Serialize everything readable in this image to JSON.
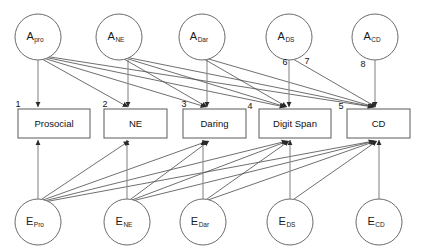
{
  "diagram": {
    "type": "path-diagram",
    "canvas": {
      "width": 430,
      "height": 251,
      "background": "#ffffff"
    },
    "colors": {
      "node_stroke": "#6b6b6b",
      "box_stroke": "#5a5a5a",
      "path_stroke": "#4a4a4a",
      "vertical_path_stroke": "#8a8a8a",
      "text": "#111111",
      "background": "#ffffff"
    },
    "genetic_factors": [
      {
        "id": "a-pro",
        "base": "A",
        "sub": "pro",
        "cx": 38,
        "cy": 37,
        "r": 23
      },
      {
        "id": "a-ne",
        "base": "A",
        "sub": "NE",
        "cx": 119,
        "cy": 37,
        "r": 23
      },
      {
        "id": "a-dar",
        "base": "A",
        "sub": "Dar",
        "cx": 202,
        "cy": 37,
        "r": 23
      },
      {
        "id": "a-ds",
        "base": "A",
        "sub": "DS",
        "cx": 289,
        "cy": 37,
        "r": 23
      },
      {
        "id": "a-cd",
        "base": "A",
        "sub": "CD",
        "cx": 375,
        "cy": 37,
        "r": 23
      }
    ],
    "observed_variables": [
      {
        "id": "box-prosocial",
        "label": "Prosocial",
        "x": 18,
        "y": 109,
        "w": 72,
        "h": 29
      },
      {
        "id": "box-ne",
        "label": "NE",
        "x": 104,
        "y": 109,
        "w": 63,
        "h": 29
      },
      {
        "id": "box-daring",
        "label": "Daring",
        "x": 183,
        "y": 109,
        "w": 63,
        "h": 29
      },
      {
        "id": "box-digit-span",
        "label": "Digit Span",
        "x": 259,
        "y": 109,
        "w": 72,
        "h": 29
      },
      {
        "id": "box-cd",
        "label": "CD",
        "x": 347,
        "y": 109,
        "w": 63,
        "h": 29
      }
    ],
    "environment_factors": [
      {
        "id": "e-pro",
        "base": "E",
        "sub": "Pro",
        "cx": 38,
        "cy": 222,
        "r": 23
      },
      {
        "id": "e-ne",
        "base": "E",
        "sub": "NE",
        "cx": 127,
        "cy": 222,
        "r": 23
      },
      {
        "id": "e-dar",
        "base": "E",
        "sub": "Dar",
        "cx": 203,
        "cy": 222,
        "r": 23
      },
      {
        "id": "e-ds",
        "base": "E",
        "sub": "DS",
        "cx": 290,
        "cy": 222,
        "r": 23
      },
      {
        "id": "e-cd",
        "base": "E",
        "sub": "CD",
        "cx": 379,
        "cy": 222,
        "r": 23
      }
    ],
    "path_numbers": [
      {
        "id": "path-number-1",
        "label": "1",
        "x": 18,
        "y": 105
      },
      {
        "id": "path-number-2",
        "label": "2",
        "x": 105,
        "y": 105
      },
      {
        "id": "path-number-3",
        "label": "3",
        "x": 184,
        "y": 105
      },
      {
        "id": "path-number-4",
        "label": "4",
        "x": 250,
        "y": 107
      },
      {
        "id": "path-number-5",
        "label": "5",
        "x": 341,
        "y": 107
      },
      {
        "id": "path-number-6",
        "label": "6",
        "x": 285,
        "y": 63
      },
      {
        "id": "path-number-7",
        "label": "7",
        "x": 307,
        "y": 62
      },
      {
        "id": "path-number-8",
        "label": "8",
        "x": 363,
        "y": 65
      }
    ],
    "genetic_paths": [
      {
        "from": "a-pro",
        "to": "box-prosocial",
        "x1": 38,
        "y1": 60,
        "x2": 38,
        "y2": 107,
        "vertical": true
      },
      {
        "from": "a-pro",
        "to": "box-ne",
        "x1": 42,
        "y1": 59,
        "x2": 128,
        "y2": 107,
        "vertical": false
      },
      {
        "from": "a-pro",
        "to": "box-daring",
        "x1": 43,
        "y1": 58,
        "x2": 206,
        "y2": 107,
        "vertical": false
      },
      {
        "from": "a-pro",
        "to": "box-digit-span",
        "x1": 44,
        "y1": 57,
        "x2": 285,
        "y2": 107,
        "vertical": false
      },
      {
        "from": "a-pro",
        "to": "box-cd",
        "x1": 44,
        "y1": 56,
        "x2": 373,
        "y2": 107,
        "vertical": false
      },
      {
        "from": "a-ne",
        "to": "box-ne",
        "x1": 128,
        "y1": 60,
        "x2": 128,
        "y2": 107,
        "vertical": true
      },
      {
        "from": "a-ne",
        "to": "box-daring",
        "x1": 124,
        "y1": 59,
        "x2": 207,
        "y2": 107,
        "vertical": false
      },
      {
        "from": "a-ne",
        "to": "box-digit-span",
        "x1": 125,
        "y1": 58,
        "x2": 286,
        "y2": 107,
        "vertical": false
      },
      {
        "from": "a-ne",
        "to": "box-cd",
        "x1": 125,
        "y1": 57,
        "x2": 374,
        "y2": 107,
        "vertical": false
      },
      {
        "from": "a-dar",
        "to": "box-daring",
        "x1": 207,
        "y1": 60,
        "x2": 207,
        "y2": 107,
        "vertical": true
      },
      {
        "from": "a-dar",
        "to": "box-digit-span",
        "x1": 204,
        "y1": 59,
        "x2": 287,
        "y2": 107,
        "vertical": false
      },
      {
        "from": "a-dar",
        "to": "box-cd",
        "x1": 205,
        "y1": 58,
        "x2": 375,
        "y2": 107,
        "vertical": false
      },
      {
        "from": "a-ds",
        "to": "box-digit-span",
        "x1": 289,
        "y1": 60,
        "x2": 289,
        "y2": 107,
        "vertical": true
      },
      {
        "from": "a-ds",
        "to": "box-cd",
        "x1": 293,
        "y1": 59,
        "x2": 376,
        "y2": 107,
        "vertical": false
      },
      {
        "from": "a-cd",
        "to": "box-cd",
        "x1": 375,
        "y1": 60,
        "x2": 375,
        "y2": 107,
        "vertical": true
      }
    ],
    "environment_paths": [
      {
        "from": "e-pro",
        "to": "box-prosocial",
        "x1": 38,
        "y1": 199,
        "x2": 38,
        "y2": 140,
        "vertical": true
      },
      {
        "from": "e-pro",
        "to": "box-ne",
        "x1": 42,
        "y1": 199,
        "x2": 129,
        "y2": 141,
        "vertical": false
      },
      {
        "from": "e-pro",
        "to": "box-daring",
        "x1": 43,
        "y1": 200,
        "x2": 208,
        "y2": 141,
        "vertical": false
      },
      {
        "from": "e-pro",
        "to": "box-digit-span",
        "x1": 44,
        "y1": 201,
        "x2": 287,
        "y2": 141,
        "vertical": false
      },
      {
        "from": "e-pro",
        "to": "box-cd",
        "x1": 44,
        "y1": 202,
        "x2": 374,
        "y2": 141,
        "vertical": false
      },
      {
        "from": "e-ne",
        "to": "box-ne",
        "x1": 127,
        "y1": 199,
        "x2": 127,
        "y2": 140,
        "vertical": true
      },
      {
        "from": "e-ne",
        "to": "box-daring",
        "x1": 131,
        "y1": 199,
        "x2": 209,
        "y2": 141,
        "vertical": false
      },
      {
        "from": "e-ne",
        "to": "box-digit-span",
        "x1": 132,
        "y1": 200,
        "x2": 288,
        "y2": 141,
        "vertical": false
      },
      {
        "from": "e-ne",
        "to": "box-cd",
        "x1": 132,
        "y1": 201,
        "x2": 375,
        "y2": 141,
        "vertical": false
      },
      {
        "from": "e-dar",
        "to": "box-daring",
        "x1": 203,
        "y1": 199,
        "x2": 203,
        "y2": 140,
        "vertical": true
      },
      {
        "from": "e-dar",
        "to": "box-digit-span",
        "x1": 207,
        "y1": 199,
        "x2": 289,
        "y2": 141,
        "vertical": false
      },
      {
        "from": "e-dar",
        "to": "box-cd",
        "x1": 208,
        "y1": 200,
        "x2": 376,
        "y2": 141,
        "vertical": false
      },
      {
        "from": "e-ds",
        "to": "box-digit-span",
        "x1": 290,
        "y1": 199,
        "x2": 290,
        "y2": 140,
        "vertical": true
      },
      {
        "from": "e-ds",
        "to": "box-cd",
        "x1": 294,
        "y1": 199,
        "x2": 377,
        "y2": 141,
        "vertical": false
      },
      {
        "from": "e-cd",
        "to": "box-cd",
        "x1": 379,
        "y1": 199,
        "x2": 379,
        "y2": 140,
        "vertical": true
      }
    ]
  }
}
